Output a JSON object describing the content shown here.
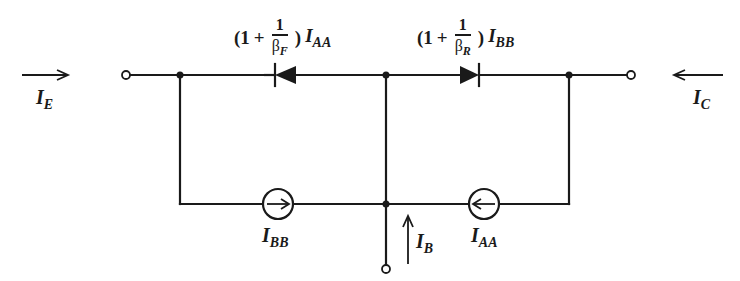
{
  "diagram": {
    "currents": {
      "emitter": {
        "symbol": "I",
        "subscript": "E",
        "direction": "right"
      },
      "collector": {
        "symbol": "I",
        "subscript": "C",
        "direction": "left"
      },
      "base": {
        "symbol": "I",
        "subscript": "B",
        "direction": "up"
      }
    },
    "diodes": [
      {
        "id": "emitter-diode",
        "orientation": "cathode-left",
        "label": {
          "open": "(1",
          "plus": "+",
          "numerator": "1",
          "beta": "β",
          "beta_sub": "F",
          "close": ")",
          "current": "I",
          "current_sub": "AA"
        }
      },
      {
        "id": "collector-diode",
        "orientation": "cathode-right",
        "label": {
          "open": "(1",
          "plus": "+",
          "numerator": "1",
          "beta": "β",
          "beta_sub": "R",
          "close": ")",
          "current": "I",
          "current_sub": "BB"
        }
      }
    ],
    "current_sources": [
      {
        "id": "source-bb",
        "arrow": "right",
        "symbol": "I",
        "subscript": "BB"
      },
      {
        "id": "source-aa",
        "arrow": "left",
        "symbol": "I",
        "subscript": "AA"
      }
    ],
    "terminals": [
      "emitter",
      "collector",
      "base"
    ],
    "colors": {
      "ink": "#1a1a1a",
      "background": "#ffffff"
    }
  }
}
